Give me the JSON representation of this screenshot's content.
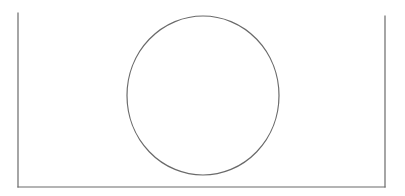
{
  "diagram": {
    "canvas": {
      "width": 405,
      "height": 196,
      "background": "#ffffff"
    },
    "stroke_color": "#6a6a6a",
    "stroke_width": 1.2,
    "container": {
      "shape": "open-top-box",
      "left_line": {
        "x1": 18,
        "y1": 13,
        "x2": 18,
        "y2": 187
      },
      "bottom_line": {
        "x1": 18,
        "y1": 187,
        "x2": 385,
        "y2": 187
      },
      "right_line": {
        "x1": 385,
        "y1": 16,
        "x2": 385,
        "y2": 187
      }
    },
    "circle": {
      "cx": 203,
      "cy": 95.5,
      "rx": 76,
      "ry": 79.5,
      "fill": "none"
    }
  }
}
